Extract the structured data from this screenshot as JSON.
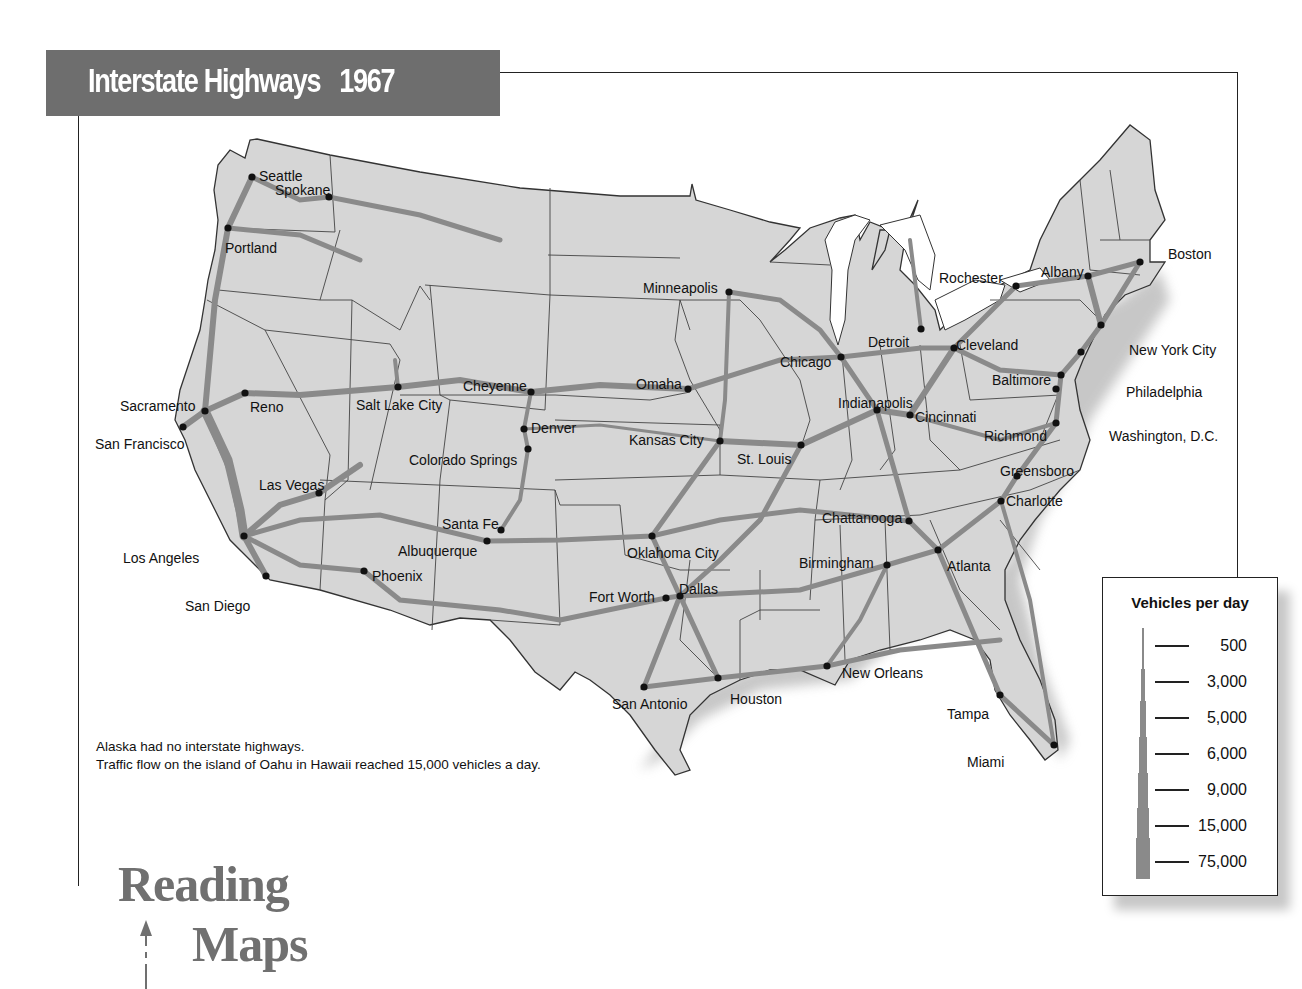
{
  "title": {
    "text": "Interstate Highways",
    "year": "1967"
  },
  "cities": [
    {
      "name": "Seattle",
      "x": 252,
      "y": 177,
      "lx": 259,
      "ly": 176
    },
    {
      "name": "Spokane",
      "x": 329,
      "y": 197,
      "lx": 275,
      "ly": 190
    },
    {
      "name": "Portland",
      "x": 228,
      "y": 228,
      "lx": 225,
      "ly": 248
    },
    {
      "name": "Sacramento",
      "x": 205,
      "y": 411,
      "lx": 120,
      "ly": 406
    },
    {
      "name": "San Francisco",
      "x": 183,
      "y": 427,
      "lx": 95,
      "ly": 444
    },
    {
      "name": "Reno",
      "x": 245,
      "y": 393,
      "lx": 250,
      "ly": 407
    },
    {
      "name": "Salt Lake City",
      "x": 398,
      "y": 387,
      "lx": 356,
      "ly": 405
    },
    {
      "name": "Cheyenne",
      "x": 531,
      "y": 392,
      "lx": 463,
      "ly": 386
    },
    {
      "name": "Denver",
      "x": 524,
      "y": 429,
      "lx": 531,
      "ly": 428
    },
    {
      "name": "Colorado Springs",
      "x": 528,
      "y": 449,
      "lx": 409,
      "ly": 460
    },
    {
      "name": "Las Vegas",
      "x": 319,
      "y": 493,
      "lx": 259,
      "ly": 485
    },
    {
      "name": "Los Angeles",
      "x": 244,
      "y": 536,
      "lx": 123,
      "ly": 558
    },
    {
      "name": "San Diego",
      "x": 266,
      "y": 576,
      "lx": 185,
      "ly": 606
    },
    {
      "name": "Phoenix",
      "x": 364,
      "y": 571,
      "lx": 372,
      "ly": 576
    },
    {
      "name": "Albuquerque",
      "x": 487,
      "y": 541,
      "lx": 398,
      "ly": 551
    },
    {
      "name": "Santa Fe",
      "x": 501,
      "y": 530,
      "lx": 442,
      "ly": 524
    },
    {
      "name": "Minneapolis",
      "x": 729,
      "y": 292,
      "lx": 643,
      "ly": 288
    },
    {
      "name": "Omaha",
      "x": 688,
      "y": 389,
      "lx": 636,
      "ly": 384
    },
    {
      "name": "Kansas City",
      "x": 720,
      "y": 441,
      "lx": 629,
      "ly": 440
    },
    {
      "name": "St. Louis",
      "x": 801,
      "y": 445,
      "lx": 737,
      "ly": 459
    },
    {
      "name": "Chicago",
      "x": 841,
      "y": 357,
      "lx": 780,
      "ly": 362
    },
    {
      "name": "Detroit",
      "x": 921,
      "y": 329,
      "lx": 868,
      "ly": 342
    },
    {
      "name": "Indianapolis",
      "x": 877,
      "y": 410,
      "lx": 838,
      "ly": 403
    },
    {
      "name": "Cincinnati",
      "x": 910,
      "y": 415,
      "lx": 915,
      "ly": 417
    },
    {
      "name": "Cleveland",
      "x": 954,
      "y": 348,
      "lx": 956,
      "ly": 345
    },
    {
      "name": "Rochester",
      "x": 1016,
      "y": 286,
      "lx": 939,
      "ly": 278
    },
    {
      "name": "Albany",
      "x": 1088,
      "y": 276,
      "lx": 1041,
      "ly": 272
    },
    {
      "name": "Boston",
      "x": 1140,
      "y": 262,
      "lx": 1168,
      "ly": 254
    },
    {
      "name": "New York City",
      "x": 1101,
      "y": 325,
      "lx": 1129,
      "ly": 350
    },
    {
      "name": "Philadelphia",
      "x": 1081,
      "y": 352,
      "lx": 1126,
      "ly": 392
    },
    {
      "name": "Baltimore",
      "x": 1061,
      "y": 375,
      "lx": 992,
      "ly": 380
    },
    {
      "name": "Washington, D.C.",
      "x": 1056,
      "y": 389,
      "lx": 1109,
      "ly": 436
    },
    {
      "name": "Richmond",
      "x": 1056,
      "y": 423,
      "lx": 984,
      "ly": 436
    },
    {
      "name": "Greensboro",
      "x": 1017,
      "y": 476,
      "lx": 1000,
      "ly": 471
    },
    {
      "name": "Charlotte",
      "x": 1001,
      "y": 501,
      "lx": 1006,
      "ly": 501
    },
    {
      "name": "Chattanooga",
      "x": 909,
      "y": 521,
      "lx": 822,
      "ly": 518
    },
    {
      "name": "Atlanta",
      "x": 938,
      "y": 550,
      "lx": 947,
      "ly": 566
    },
    {
      "name": "Birmingham",
      "x": 887,
      "y": 565,
      "lx": 799,
      "ly": 563
    },
    {
      "name": "Oklahoma City",
      "x": 652,
      "y": 536,
      "lx": 627,
      "ly": 553
    },
    {
      "name": "Fort Worth",
      "x": 666,
      "y": 598,
      "lx": 589,
      "ly": 597
    },
    {
      "name": "Dallas",
      "x": 680,
      "y": 596,
      "lx": 679,
      "ly": 589
    },
    {
      "name": "San Antonio",
      "x": 644,
      "y": 687,
      "lx": 612,
      "ly": 704
    },
    {
      "name": "Houston",
      "x": 718,
      "y": 678,
      "lx": 730,
      "ly": 699
    },
    {
      "name": "New Orleans",
      "x": 827,
      "y": 666,
      "lx": 842,
      "ly": 673
    },
    {
      "name": "Tampa",
      "x": 1000,
      "y": 695,
      "lx": 947,
      "ly": 714
    },
    {
      "name": "Miami",
      "x": 1054,
      "y": 745,
      "lx": 967,
      "ly": 762
    }
  ],
  "notes": [
    "Alaska had no interstate highways.",
    "Traffic flow on the island of Oahu in Hawaii reached 15,000 vehicles a day."
  ],
  "legend": {
    "title": "Vehicles per day",
    "items": [
      "500",
      "3,000",
      "5,000",
      "6,000",
      "9,000",
      "15,000",
      "75,000"
    ]
  },
  "branding": {
    "line1": "Reading",
    "line2": "Maps"
  },
  "colors": {
    "title_bar": "#6e6e6e",
    "land": "#d4d4d4",
    "highway": "#8a8a8a",
    "border": "#333333"
  }
}
